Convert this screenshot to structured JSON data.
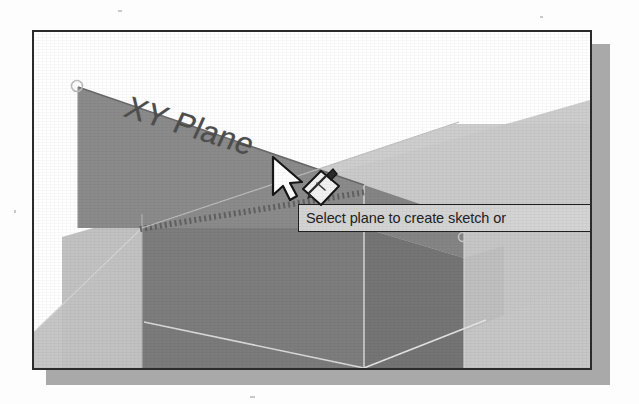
{
  "figure": {
    "kind": "cad-viewport-screenshot",
    "application_hint": "3D parametric CAD modeler plane selection"
  },
  "viewport": {
    "name": "3D graphics viewport",
    "background_color": "#ffffff",
    "border_color": "#2b2b2b",
    "shadow_color": "#a9a9a9"
  },
  "labels": {
    "xy_plane": "XY Plane"
  },
  "tooltip": {
    "text": "Select plane to create sketch or",
    "background_color": "#d4d4d4",
    "border_color": "#1f1f1f",
    "text_color": "#232323",
    "clipped": "true"
  },
  "cursor": {
    "pointer_icon": "arrow-cursor-icon",
    "badge_icon": "create-sketch-pencil-icon"
  },
  "planes": [
    {
      "id": "xy-plane-highlighted",
      "name": "XY Plane",
      "state": "highlighted",
      "fill_color": "#8a8a8a",
      "edge_style": "dashed-bottom"
    },
    {
      "id": "yz-plane-front",
      "name": "YZ Plane",
      "state": "normal",
      "fill_color": "#7e7e7e"
    },
    {
      "id": "zx-plane-right",
      "name": "ZX Plane",
      "state": "normal",
      "fill_color": "#737373"
    },
    {
      "id": "ground-plane",
      "name": "Ground Plane",
      "state": "normal",
      "fill_color": "#c6c6c6"
    },
    {
      "id": "back-plane",
      "name": "Back Plane",
      "state": "normal",
      "fill_color": "#cbcbcb"
    }
  ],
  "handles": [
    {
      "id": "handle-top-left",
      "name": "plane-corner-handle",
      "cx": 43,
      "cy": 55
    },
    {
      "id": "handle-right",
      "name": "plane-corner-handle",
      "cx": 428,
      "cy": 205
    }
  ],
  "colors": {
    "plane_light": "#c8c8c8",
    "plane_mid": "#8c8c8c",
    "plane_dark": "#7a7a7a",
    "plane_darker": "#6e6e6e",
    "line_light": "#e2e2e2",
    "page_background": "#fdfdfd"
  }
}
